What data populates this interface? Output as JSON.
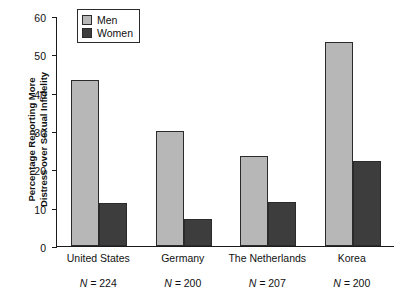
{
  "chart_data": {
    "type": "bar",
    "title": "",
    "xlabel": "",
    "ylabel": "Percentage Reporting More\nDistress over Sexual Infidelity",
    "ylim": [
      0,
      60
    ],
    "yticks": [
      0,
      10,
      20,
      30,
      40,
      50,
      60
    ],
    "ytick_labels": [
      "0",
      "10",
      "20",
      "30",
      "40",
      "50",
      "60"
    ],
    "grid": false,
    "legend_position": "top-left-inside",
    "categories": [
      "United States",
      "Germany",
      "The Netherlands",
      "Korea"
    ],
    "sample_sizes": [
      "N = 224",
      "N = 200",
      "N = 207",
      "N = 200"
    ],
    "sample_size_values": [
      224,
      200,
      207,
      200
    ],
    "series": [
      {
        "name": "Men",
        "color": "#b7b7b7",
        "values": [
          43.3,
          30.0,
          23.4,
          53.3
        ]
      },
      {
        "name": "Women",
        "color": "#3d3d3d",
        "values": [
          11.2,
          7.0,
          11.5,
          22.2
        ]
      }
    ]
  },
  "legend": {
    "items": [
      {
        "label": "Men",
        "color": "#b7b7b7"
      },
      {
        "label": "Women",
        "color": "#3d3d3d"
      }
    ]
  },
  "colors": {
    "men": "#b7b7b7",
    "women": "#3d3d3d",
    "axis": "#1b1b1b",
    "background": "#ffffff"
  }
}
